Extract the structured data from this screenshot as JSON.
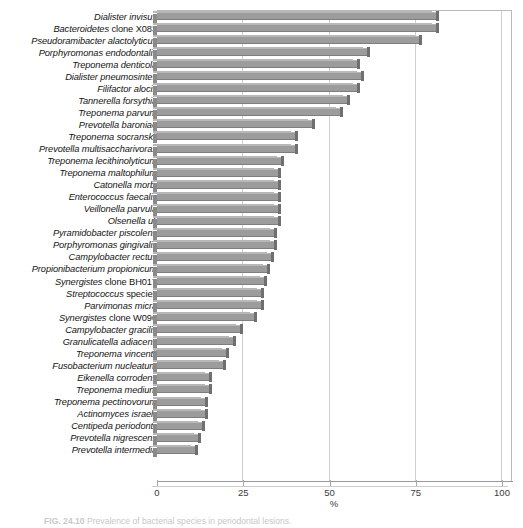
{
  "figure": {
    "caption_number": "FIG. 24.10",
    "caption_text": "Prevalence of bacterial species in periodontal lesions."
  },
  "axis": {
    "x_title": "%",
    "x_ticks": [
      "0",
      "25",
      "50",
      "75",
      "100"
    ],
    "x_tick_values": [
      0,
      25,
      50,
      75,
      100
    ]
  },
  "chart_data": {
    "type": "bar",
    "orientation": "horizontal",
    "title": "",
    "xlabel": "%",
    "ylabel": "",
    "xlim": [
      0,
      100
    ],
    "grid": true,
    "legend": "none",
    "bar_color": "#9c9c9c",
    "categories": [
      "Dialister invisus",
      "Bacteroidetes clone X083",
      "Pseudoramibacter alactolyticus",
      "Porphyromonas endodontalis",
      "Treponema denticola",
      "Dialister pneumosintes",
      "Filifactor alocis",
      "Tannerella forsythia",
      "Treponema parvum",
      "Prevotella baroniae",
      "Treponema socranskii",
      "Prevotella multisaccharivorax",
      "Treponema lecithinolyticum",
      "Treponema maltophilum",
      "Catonella morbi",
      "Enterococcus faecalis",
      "Veillonella parvula",
      "Olsenella uli",
      "Pyramidobacter piscolens",
      "Porphyromonas gingivalis",
      "Campylobacter rectus",
      "Propionibacterium propionicum",
      "Synergistes clone BH017",
      "Streptococcus species",
      "Parvimonas micra",
      "Synergistes clone W090",
      "Campylobacter gracilis",
      "Granulicatella adiacens",
      "Treponema vincentii",
      "Fusobacterium nucleatum",
      "Eikenella corrodens",
      "Treponema medium",
      "Treponema pectinovorum",
      "Actinomyces israelii",
      "Centipeda periodontii",
      "Prevotella nigrescens",
      "Prevotella intermedia"
    ],
    "category_nonitalic_tails": {
      "Bacteroidetes clone X083": "clone X083",
      "Synergistes clone BH017": "clone BH017",
      "Synergistes clone W090": "clone W090",
      "Streptococcus species": "species"
    },
    "values": [
      81,
      81,
      76,
      61,
      58,
      59,
      58,
      55,
      53,
      45,
      40,
      40,
      36,
      35,
      35,
      35,
      35,
      35,
      34,
      34,
      33,
      32,
      31,
      30,
      30,
      28,
      24,
      22,
      20,
      19,
      15,
      15,
      14,
      14,
      13,
      12,
      11
    ]
  }
}
